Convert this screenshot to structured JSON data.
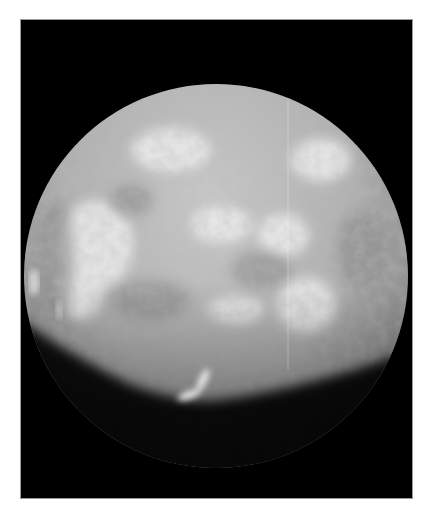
{
  "image": {
    "subject": "moon-disc",
    "alt": "Grayscale photograph of a cratered moon, partially lit, against black space",
    "background_color": "#ffffff",
    "frame_color": "#000000",
    "frame_border_color": "#9a9a9a",
    "disc": {
      "center": [
        195,
        256
      ],
      "radius": 192,
      "surface_color": "#b4b4b4",
      "highlight_color": "#e6e6e6",
      "shadow_color": "#000000"
    }
  }
}
